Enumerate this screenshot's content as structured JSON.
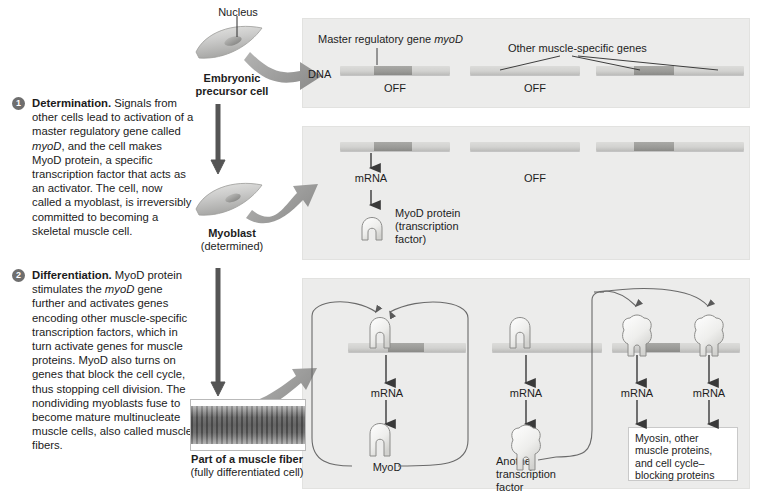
{
  "captions": [
    {
      "number": "1",
      "heading": "Determination.",
      "text_before_italic": " Signals from other cells lead to activation of a master regulatory gene called ",
      "italic": "myoD",
      "text_after_italic": ", and the cell makes MyoD protein, a specific transcription factor that acts as an activator. The cell, now called a myoblast, is irreversibly committed to becoming a skeletal muscle cell."
    },
    {
      "number": "2",
      "heading": "Differentiation.",
      "text_before_italic": " MyoD protein stimulates the ",
      "italic": "myoD",
      "text_after_italic": " gene further and activates genes encoding other muscle-specific transcription factors, which in turn activate genes for muscle proteins. MyoD also turns on genes that block the cell cycle, thus stopping cell division. The nondividing myoblasts fuse to become mature multinucleate muscle cells, also called muscle fibers."
    }
  ],
  "cells": [
    {
      "name": "Embryonic precursor cell",
      "label_line1": "Embryonic",
      "label_line2": "precursor cell",
      "nucleus_label": "Nucleus"
    },
    {
      "name": "Myoblast",
      "label_line1": "Myoblast",
      "label_line2": "(determined)"
    },
    {
      "name": "Muscle fiber",
      "label_line1": "Part of a muscle fiber",
      "label_line2": "(fully differentiated cell)"
    }
  ],
  "panel1": {
    "dna_label": "DNA",
    "master_gene_label": "Master regulatory gene myoD",
    "master_gene_label_plain": "Master regulatory gene ",
    "master_gene_italic": "myoD",
    "other_genes_label": "Other muscle-specific genes",
    "off_left": "OFF",
    "off_right": "OFF"
  },
  "panel2": {
    "mrna": "mRNA",
    "off": "OFF",
    "protein_line1": "MyoD protein",
    "protein_line2": "(transcription",
    "protein_line3": "factor)"
  },
  "panel3": {
    "mrna_1": "mRNA",
    "mrna_2": "mRNA",
    "mrna_3": "mRNA",
    "mrna_4": "mRNA",
    "myod_label": "MyoD",
    "another_tf_line1": "Another",
    "another_tf_line2": "transcription",
    "another_tf_line3": "factor",
    "products_line1": "Myosin, other",
    "products_line2": "muscle proteins,",
    "products_line3": "and cell cycle–",
    "products_line4": "blocking proteins"
  },
  "colors": {
    "panel_background": "#ececeb",
    "dna_strand": "#d2d2d0",
    "gene_highlight": "#9a9a97",
    "big_arrow": "#9b9b9b",
    "thin_arrow": "#4a4a4a",
    "number_badge": "#6e6e6e",
    "protein_fill": "#f2f2f0",
    "text": "#1b1b1b"
  }
}
